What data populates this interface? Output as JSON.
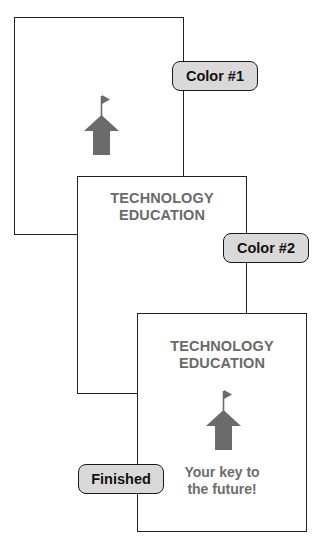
{
  "diagram": {
    "colors": {
      "border": "#222222",
      "label_fill": "#d9d9d9",
      "ink_gray": "#6a6a6a",
      "icon_gray": "#6b6b6b"
    },
    "stages": [
      {
        "label": "Color #1",
        "title_line1": "",
        "title_line2": "",
        "tagline_line1": "",
        "tagline_line2": "",
        "icon": "house-flag-icon"
      },
      {
        "label": "Color #2",
        "title_line1": "TECHNOLOGY",
        "title_line2": "EDUCATION",
        "tagline_line1": "Yo",
        "tagline_line2": "th",
        "icon": ""
      },
      {
        "label": "Finished",
        "title_line1": "TECHNOLOGY",
        "title_line2": "EDUCATION",
        "tagline_line1": "Your key to",
        "tagline_line2": "the future!",
        "icon": "house-flag-icon"
      }
    ]
  }
}
